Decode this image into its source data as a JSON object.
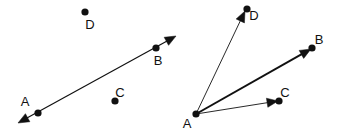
{
  "figure": {
    "width": 343,
    "height": 133,
    "background_color": "#ffffff",
    "ink_color": "#111111",
    "panels": [
      {
        "id": "left",
        "name": "line-panel",
        "description": "A double-headed straight line passing through labelled points A and B, with isolated points C and D",
        "points": [
          {
            "label": "A",
            "x": 38,
            "y": 113,
            "dot": true,
            "label_x": 25,
            "label_y": 106
          },
          {
            "label": "B",
            "x": 156,
            "y": 48,
            "dot": true,
            "label_x": 158,
            "label_y": 65
          },
          {
            "label": "C",
            "x": 115,
            "y": 101,
            "dot": true,
            "label_x": 120,
            "label_y": 97
          },
          {
            "label": "D",
            "x": 85,
            "y": 12,
            "dot": true,
            "label_x": 90,
            "label_y": 29
          }
        ],
        "segments": [
          {
            "name": "line-AB",
            "from": "A",
            "to": "B",
            "x1": 18,
            "y1": 123,
            "x2": 176,
            "y2": 36,
            "stroke_width": 1.2,
            "arrow_start": true,
            "arrow_end": true
          }
        ]
      },
      {
        "id": "right",
        "name": "vector-panel",
        "description": "Three vectors originating at A and terminating at D, B and C",
        "points": [
          {
            "label": "A",
            "x": 196,
            "y": 114,
            "dot": true,
            "label_x": 187,
            "label_y": 128
          },
          {
            "label": "B",
            "x": 312,
            "y": 48,
            "dot": true,
            "label_x": 319,
            "label_y": 44
          },
          {
            "label": "C",
            "x": 279,
            "y": 101,
            "dot": true,
            "label_x": 285,
            "label_y": 97
          },
          {
            "label": "D",
            "x": 247,
            "y": 9,
            "dot": true,
            "label_x": 254,
            "label_y": 20
          }
        ],
        "segments": [
          {
            "name": "vector-AD",
            "from": "A",
            "to": "D",
            "x1": 196,
            "y1": 114,
            "x2": 245,
            "y2": 11,
            "stroke_width": 0.9,
            "arrow_start": false,
            "arrow_end": true
          },
          {
            "name": "vector-AB",
            "from": "A",
            "to": "B",
            "x1": 196,
            "y1": 114,
            "x2": 311,
            "y2": 49,
            "stroke_width": 2.0,
            "arrow_start": false,
            "arrow_end": true
          },
          {
            "name": "vector-AC",
            "from": "A",
            "to": "C",
            "x1": 196,
            "y1": 114,
            "x2": 278,
            "y2": 101,
            "stroke_width": 0.9,
            "arrow_start": false,
            "arrow_end": true
          }
        ]
      }
    ]
  }
}
